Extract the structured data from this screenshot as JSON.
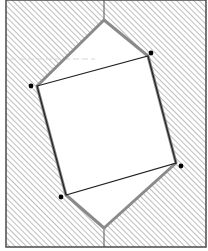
{
  "diagram": {
    "title": "",
    "width": 208,
    "height": 251,
    "colors": {
      "background": "#ffffff",
      "frame": "#555555",
      "hatch": "#9a9a9a",
      "hexagon_stroke": "#8a8a8a",
      "square_stroke": "#222222",
      "dot": "#000000",
      "faint_line": "#d6d6d6"
    },
    "frame": {
      "x": 6,
      "y": 0,
      "width": 200,
      "height": 247
    },
    "hexagon": {
      "points": [
        [
          104,
          20
        ],
        [
          148,
          56
        ],
        [
          176,
          163
        ],
        [
          104,
          228
        ],
        [
          66,
          195
        ],
        [
          37,
          86
        ]
      ],
      "stroke_width": 3
    },
    "inner_square": {
      "points": [
        [
          37,
          86
        ],
        [
          148,
          56
        ],
        [
          176,
          163
        ],
        [
          66,
          195
        ]
      ],
      "stroke_width": 1.2
    },
    "axis_lines": [
      {
        "x1": 104,
        "y1": 0,
        "x2": 104,
        "y2": 20
      },
      {
        "x1": 104,
        "y1": 228,
        "x2": 104,
        "y2": 247
      }
    ],
    "dots": [
      {
        "cx": 31,
        "cy": 86,
        "r": 2.4
      },
      {
        "cx": 151,
        "cy": 53,
        "r": 2.4
      },
      {
        "cx": 181,
        "cy": 166,
        "r": 2.4
      },
      {
        "cx": 61,
        "cy": 197,
        "r": 2.4
      }
    ],
    "faint_line": {
      "x1": 10,
      "y1": 59,
      "x2": 95,
      "y2": 59
    }
  }
}
